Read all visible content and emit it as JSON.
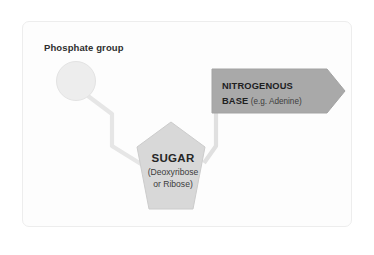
{
  "diagram": {
    "background_color": "#ffffff",
    "card_color": "#fdfdfd",
    "card_border_color": "#ededed"
  },
  "phosphate": {
    "label": "Phosphate group",
    "shape": "circle",
    "fill_color": "#ededed",
    "stroke_color": "#e2e2e2"
  },
  "sugar": {
    "title": "SUGAR",
    "sub_line1": "(Deoxyribose",
    "sub_line2": "or Ribose)",
    "shape": "pentagon",
    "fill_color": "#d8d8d8",
    "stroke_color": "#c9c9c9"
  },
  "base": {
    "line1": "NITROGENOUS",
    "line2": "BASE",
    "example": " (e.g. Adenine)",
    "shape": "arrow-right",
    "fill_color": "#a9a9a9",
    "stroke_color": "#a0a0a0"
  },
  "connectors": {
    "phosphate_to_sugar_color": "#e4e4e4",
    "base_to_sugar_color": "#dedede"
  }
}
